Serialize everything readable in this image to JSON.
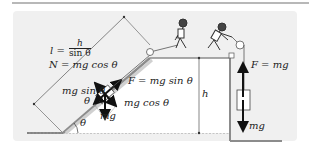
{
  "diagram": {
    "colors": {
      "background": "#ffffff",
      "panel": "#f0f0f0",
      "ground": "#7a7a7a",
      "arrow": "#111111",
      "text": "#222222"
    },
    "incline": {
      "length_label_lhs": "l =",
      "length_fraction_num": "h",
      "length_fraction_den": "sin θ",
      "normal_force": "N = mg cos θ",
      "parallel_component": "mg sin θ",
      "perpendicular_component": "mg cos θ",
      "gravity": "mg",
      "angle_force": "θ",
      "angle_base": "θ",
      "pull_force": "F = mg sin θ"
    },
    "height_label": "h",
    "vertical": {
      "pull_force": "F = mg",
      "gravity": "mg"
    },
    "icons": [
      "person-pulling-incline-icon",
      "person-pulling-vertical-icon",
      "pulley-icon",
      "block-icon"
    ]
  }
}
